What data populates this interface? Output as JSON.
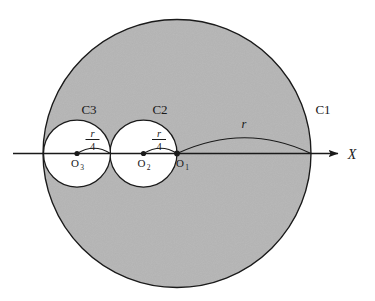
{
  "figure": {
    "colors": {
      "fill_shaded": "#b5b5b5",
      "fill_unshaded": "#ffffff",
      "stroke": "#1a1a1a",
      "background": "#ffffff"
    },
    "axis": {
      "name": "X",
      "label": "X",
      "orientation": "horizontal",
      "arrow": "right"
    },
    "circles": [
      {
        "id": "C1",
        "label": "C1",
        "center_point_label": "O1",
        "center_label_base": "O",
        "center_label_sub": "1",
        "radius_label": "r",
        "cx": 177,
        "cy": 153.5,
        "r": 134,
        "fill": "shaded"
      },
      {
        "id": "C2",
        "label": "C2",
        "center_point_label": "O2",
        "center_label_base": "O",
        "center_label_sub": "2",
        "radius_label_numerator": "r",
        "radius_label_denominator": "4",
        "cx": 143.5,
        "cy": 153.5,
        "r": 33.5,
        "fill": "unshaded"
      },
      {
        "id": "C3",
        "label": "C3",
        "center_point_label": "O3",
        "center_label_base": "O",
        "center_label_sub": "3",
        "radius_label_numerator": "r",
        "radius_label_denominator": "4",
        "cx": 77,
        "cy": 153.5,
        "r": 33.5,
        "fill": "unshaded"
      }
    ],
    "points": [
      {
        "id": "O1",
        "base": "O",
        "sub": "1",
        "x": 177,
        "y": 153.5
      },
      {
        "id": "O2",
        "base": "O",
        "sub": "2",
        "x": 143.5,
        "y": 153.5
      },
      {
        "id": "O3",
        "base": "O",
        "sub": "3",
        "x": 77,
        "y": 153.5
      }
    ],
    "annotations": {
      "c1_label": "C1",
      "c2_label": "C2",
      "c3_label": "C3",
      "radius_r": "r",
      "frac_numerator": "r",
      "frac_denominator": "4",
      "axis_label": "X",
      "o1_base": "O",
      "o1_sub": "1",
      "o2_base": "O",
      "o2_sub": "2",
      "o3_base": "O",
      "o3_sub": "3"
    }
  }
}
